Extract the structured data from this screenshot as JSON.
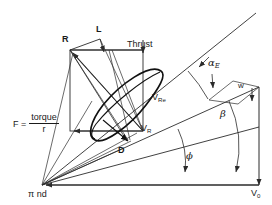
{
  "figure": {
    "type": "propeller-blade-element-force-velocity-diagram",
    "background": "#ffffff",
    "line_color": "#2b2b2b",
    "airfoil_color": "#111111",
    "width": 272,
    "height": 205
  },
  "labels": {
    "resultant": "R",
    "lift": "L",
    "thrust": "Thrust",
    "drag": "D",
    "force_lhs": "F  =",
    "force_numerator": "torque",
    "force_denominator": "r",
    "rotational_speed": "π nd",
    "freestream_velocity": "V",
    "freestream_velocity_sub": "0",
    "relative_velocity": "V",
    "relative_velocity_sub": "R",
    "effective_relative_velocity": "V",
    "effective_relative_velocity_sub": "Re",
    "induced_velocity": "w",
    "angle_of_attack": "α",
    "angle_of_attack_sub": "E",
    "blade_angle": "β",
    "inflow_angle": "ϕ"
  },
  "geometry": {
    "hub_x": 42,
    "hub_y": 185,
    "baseline_end_x": 259,
    "baseline_y": 185,
    "chord_line_end_x": 256,
    "chord_line_end_y": 13,
    "v_re_line_end_x": 259,
    "v_re_line_end_y": 87,
    "v_r_line_end_x": 259,
    "v_r_line_end_y": 127,
    "rect_left": 70,
    "rect_top": 50,
    "rect_right": 143,
    "rect_bottom": 131
  }
}
